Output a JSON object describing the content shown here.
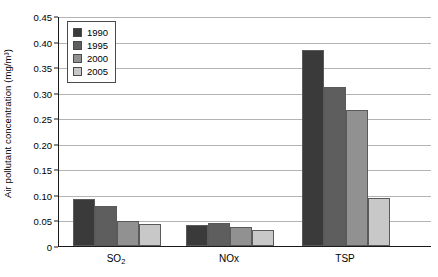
{
  "chart_data": {
    "type": "bar",
    "title": "",
    "subtitle": "",
    "xlabel": "",
    "ylabel": "Air pollutant concentration (mg/m³)",
    "categories": [
      "SO₂",
      "NOₓ",
      "TSP"
    ],
    "category_plain": [
      "SO2",
      "NOx",
      "TSP"
    ],
    "series": [
      {
        "name": "1990",
        "color": "#3a3a3a",
        "values": [
          0.092,
          0.041,
          0.383
        ]
      },
      {
        "name": "1995",
        "color": "#5e5e5e",
        "values": [
          0.079,
          0.046,
          0.312
        ]
      },
      {
        "name": "2000",
        "color": "#919191",
        "values": [
          0.048,
          0.037,
          0.267
        ]
      },
      {
        "name": "2005",
        "color": "#c8c8c8",
        "values": [
          0.044,
          0.032,
          0.094
        ]
      }
    ],
    "ylim": [
      0,
      0.45
    ],
    "ytick_values": [
      0,
      0.05,
      0.1,
      0.15,
      0.2,
      0.25,
      0.3,
      0.35,
      0.4,
      0.45
    ],
    "ytick_labels": [
      "0",
      "0.05",
      "0.10",
      "0.15",
      "0.20",
      "0.25",
      "0.30",
      "0.35",
      "0.40",
      "0.45"
    ],
    "grid": true,
    "grid_axis": "y",
    "legend_position": "top-left-inside",
    "legend_entries": [
      "1990",
      "1995",
      "2000",
      "2005"
    ],
    "bar_border_color": "#5a5a5a",
    "axis_color": "#1a1a1a",
    "grid_color": "#b4b4b4",
    "background": "#ffffff"
  }
}
